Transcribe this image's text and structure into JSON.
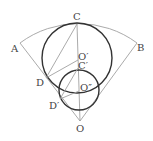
{
  "diagram": {
    "labels": {
      "A": "A",
      "B": "B",
      "C": "C",
      "D": "D",
      "D_prime": "D′",
      "O": "O",
      "O_prime": "O′",
      "C_prime": "C′",
      "O_double_prime": "O″"
    },
    "colors": {
      "thin_line": "#9a9a9a",
      "thick_circle": "#333333",
      "label": "#444444"
    }
  }
}
